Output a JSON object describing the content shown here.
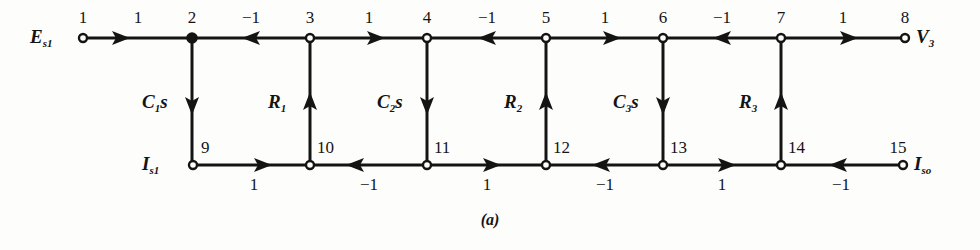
{
  "figure": {
    "caption": "(a)",
    "type": "signal-flow-graph",
    "background_color": "#fdfdfc",
    "line_color": "#141414"
  },
  "terminals": {
    "input_voltage": {
      "symbol": "E",
      "subscript": "s1",
      "node": "1"
    },
    "output_voltage": {
      "symbol": "V",
      "subscript": "3",
      "node": "8"
    },
    "input_current": {
      "symbol": "I",
      "subscript": "s1",
      "node": "9"
    },
    "output_current": {
      "symbol": "I",
      "subscript": "so",
      "node": "15"
    }
  },
  "nodes": {
    "top": [
      {
        "id": "1",
        "label": "1",
        "x": 83,
        "y": 38,
        "filled": false
      },
      {
        "id": "2",
        "label": "2",
        "x": 192,
        "y": 38,
        "filled": true
      },
      {
        "id": "3",
        "label": "3",
        "x": 310,
        "y": 38,
        "filled": false
      },
      {
        "id": "4",
        "label": "4",
        "x": 427,
        "y": 38,
        "filled": false
      },
      {
        "id": "5",
        "label": "5",
        "x": 546,
        "y": 38,
        "filled": false
      },
      {
        "id": "6",
        "label": "6",
        "x": 663,
        "y": 38,
        "filled": false
      },
      {
        "id": "7",
        "label": "7",
        "x": 781,
        "y": 38,
        "filled": false
      },
      {
        "id": "8",
        "label": "8",
        "x": 905,
        "y": 38,
        "filled": false
      }
    ],
    "bottom": [
      {
        "id": "9",
        "label": "9",
        "x": 193,
        "y": 165,
        "filled": false
      },
      {
        "id": "10",
        "label": "10",
        "x": 310,
        "y": 165,
        "filled": false
      },
      {
        "id": "11",
        "label": "11",
        "x": 427,
        "y": 165,
        "filled": false
      },
      {
        "id": "12",
        "label": "12",
        "x": 546,
        "y": 165,
        "filled": false
      },
      {
        "id": "13",
        "label": "13",
        "x": 663,
        "y": 165,
        "filled": false
      },
      {
        "id": "14",
        "label": "14",
        "x": 781,
        "y": 165,
        "filled": false
      },
      {
        "id": "15",
        "label": "15",
        "x": 903,
        "y": 165,
        "filled": false
      }
    ]
  },
  "top_branches": [
    {
      "from": "1",
      "to": "2",
      "gain": "1",
      "direction": "right"
    },
    {
      "from": "3",
      "to": "2",
      "gain": "−1",
      "direction": "left"
    },
    {
      "from": "3",
      "to": "4",
      "gain": "1",
      "direction": "right"
    },
    {
      "from": "5",
      "to": "4",
      "gain": "−1",
      "direction": "left"
    },
    {
      "from": "5",
      "to": "6",
      "gain": "1",
      "direction": "right"
    },
    {
      "from": "7",
      "to": "6",
      "gain": "−1",
      "direction": "left"
    },
    {
      "from": "7",
      "to": "8",
      "gain": "1",
      "direction": "right"
    }
  ],
  "bottom_branches": [
    {
      "from": "9",
      "to": "10",
      "gain": "1",
      "direction": "right"
    },
    {
      "from": "11",
      "to": "10",
      "gain": "−1",
      "direction": "left"
    },
    {
      "from": "11",
      "to": "12",
      "gain": "1",
      "direction": "right"
    },
    {
      "from": "13",
      "to": "12",
      "gain": "−1",
      "direction": "left"
    },
    {
      "from": "13",
      "to": "14",
      "gain": "1",
      "direction": "right"
    },
    {
      "from": "15",
      "to": "14",
      "gain": "−1",
      "direction": "left"
    }
  ],
  "vertical_branches": [
    {
      "label": "C1s",
      "symbol": "C",
      "subscript": "1",
      "suffix": "s",
      "top_node": "2",
      "bottom_node": "9",
      "direction": "down",
      "x": 192
    },
    {
      "label": "R1",
      "symbol": "R",
      "subscript": "1",
      "suffix": "",
      "top_node": "3",
      "bottom_node": "10",
      "direction": "up",
      "x": 310
    },
    {
      "label": "C2s",
      "symbol": "C",
      "subscript": "2",
      "suffix": "s",
      "top_node": "4",
      "bottom_node": "11",
      "direction": "down",
      "x": 427
    },
    {
      "label": "R2",
      "symbol": "R",
      "subscript": "2",
      "suffix": "",
      "top_node": "5",
      "bottom_node": "12",
      "direction": "up",
      "x": 546
    },
    {
      "label": "C3s",
      "symbol": "C",
      "subscript": "3",
      "suffix": "s",
      "top_node": "6",
      "bottom_node": "13",
      "direction": "down",
      "x": 663
    },
    {
      "label": "R3",
      "symbol": "R",
      "subscript": "3",
      "suffix": "",
      "top_node": "7",
      "bottom_node": "14",
      "direction": "up",
      "x": 781
    }
  ]
}
